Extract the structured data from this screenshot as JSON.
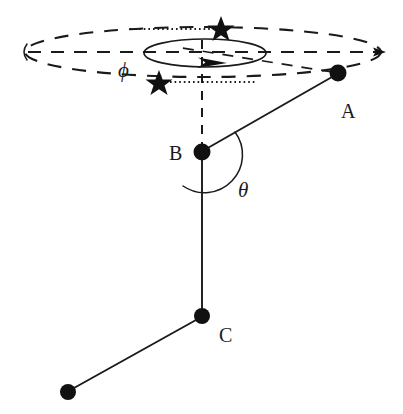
{
  "figure": {
    "background_color": "#ffffff",
    "ink_color": "#1a1a1a",
    "width": 403,
    "height": 414,
    "labels": {
      "point_a": "A",
      "point_b": "B",
      "point_c": "C",
      "angle_phi": "ϕ",
      "angle_theta": "θ"
    },
    "nodes": [
      {
        "id": "A",
        "label": "A",
        "cx": 338,
        "cy": 73,
        "r": 8.5,
        "label_x": 348,
        "label_y": 117
      },
      {
        "id": "B",
        "label": "B",
        "cx": 202,
        "cy": 152,
        "r": 8.5,
        "label_x": 170,
        "label_y": 160
      },
      {
        "id": "C",
        "label": "C",
        "cx": 202,
        "cy": 316,
        "r": 8.0,
        "label_x": 223,
        "label_y": 341
      },
      {
        "id": "D",
        "label": "",
        "cx": 68,
        "cy": 392,
        "r": 8.0,
        "label_x": 0,
        "label_y": 0
      }
    ],
    "segments": [
      {
        "id": "segment-ab",
        "from": "A",
        "to": "B",
        "x1": 332,
        "y1": 77,
        "x2": 206,
        "y2": 149
      },
      {
        "id": "segment-bc",
        "from": "B",
        "to": "C",
        "x1": 202,
        "y1": 159,
        "x2": 202,
        "y2": 310
      },
      {
        "id": "segment-cd",
        "from": "C",
        "to": "D",
        "x1": 196,
        "y1": 320,
        "x2": 74,
        "y2": 388
      }
    ],
    "outer_ellipse": {
      "cx": 203,
      "cy": 52,
      "rx": 178,
      "ry": 25,
      "style": "dashed"
    },
    "inner_ellipse": {
      "cx": 205,
      "cy": 53,
      "rx": 61,
      "ry": 14,
      "style": "solid"
    },
    "horizontal_axis": {
      "x1": 28,
      "y1": 52,
      "x2": 384,
      "y2": 52,
      "style": "dashed",
      "arrow_end": "right"
    },
    "vertical_axis": {
      "x1": 202,
      "y1": 52,
      "x2": 202,
      "y2": 146,
      "style": "dashed"
    },
    "stars": [
      {
        "id": "star-upper",
        "cx": 221,
        "cy": 28,
        "r": 12
      },
      {
        "id": "star-lower",
        "cx": 159,
        "cy": 82,
        "r": 12
      }
    ],
    "dotted_guides": [
      {
        "id": "dotted-upper",
        "x1": 130,
        "y1": 29,
        "x2": 213,
        "y2": 29
      },
      {
        "id": "dotted-lower",
        "x1": 170,
        "y1": 82,
        "x2": 256,
        "y2": 82
      }
    ],
    "leader_dashed": {
      "id": "leader-a-to-ring",
      "x1": 332,
      "y1": 72,
      "x2": 172,
      "y2": 46
    },
    "phi_arrow": {
      "cx": 212,
      "cy": 62,
      "angle_deg": 10
    },
    "theta_arc": {
      "cx": 202,
      "cy": 152,
      "r": 38,
      "start_deg": -30,
      "end_deg": 90
    },
    "phi_label_pos": {
      "x": 118,
      "y": 76
    },
    "theta_label_pos": {
      "x": 238,
      "y": 196
    },
    "left_tick_arc": {
      "x": 24,
      "y": 52,
      "r": 9
    }
  }
}
